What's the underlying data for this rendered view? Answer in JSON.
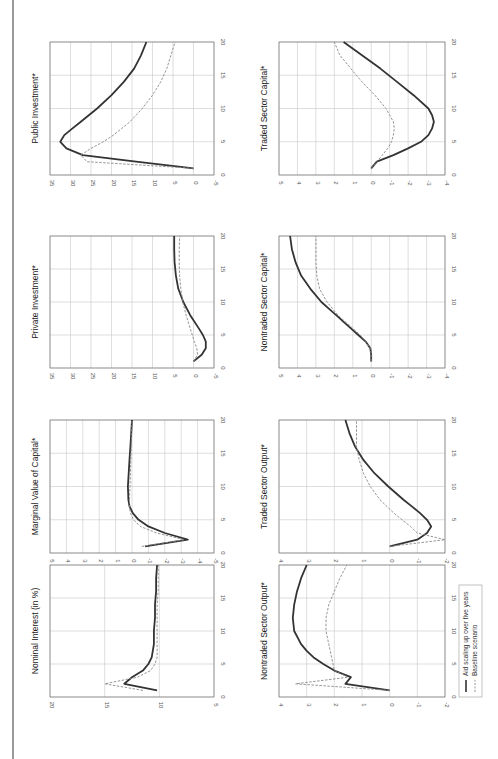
{
  "figure": {
    "orientation": "rotated-90-ccw",
    "colors": {
      "scaling": "#333333",
      "baseline": "#888888",
      "grid": "#c8c8c8",
      "axis": "#777777"
    }
  },
  "legend": {
    "items": [
      {
        "label": "Aid scaling up over five years",
        "style": "solid"
      },
      {
        "label": "Baseline scenario",
        "style": "dashed"
      }
    ]
  },
  "chart_data": [
    {
      "type": "line",
      "title": "Public Investment*",
      "xlabel": "",
      "ylabel": "",
      "xlim": [
        0,
        20
      ],
      "ylim": [
        -5,
        35
      ],
      "xticks": [
        0,
        5,
        10,
        15,
        20
      ],
      "yticks": [
        -5,
        0,
        5,
        10,
        15,
        20,
        25,
        30,
        35
      ],
      "grid": true,
      "x": [
        1,
        2,
        3,
        4,
        5,
        6,
        7,
        8,
        10,
        12,
        14,
        16,
        18,
        20
      ],
      "series": [
        {
          "name": "Aid scaling up over five years",
          "values": [
            0,
            14,
            27,
            31,
            32.5,
            31.5,
            29.5,
            27.5,
            23.5,
            20,
            17,
            14.5,
            12.8,
            11.5
          ]
        },
        {
          "name": "Baseline scenario",
          "values": [
            0,
            26,
            27.5,
            25,
            22,
            19.5,
            17.5,
            15.5,
            12.5,
            10,
            8,
            6.5,
            5.5,
            4.5
          ]
        }
      ]
    },
    {
      "type": "line",
      "title": "Private Investment*",
      "xlabel": "",
      "ylabel": "",
      "xlim": [
        0,
        20
      ],
      "ylim": [
        -5,
        35
      ],
      "xticks": [
        0,
        5,
        10,
        15,
        20
      ],
      "yticks": [
        -5,
        0,
        5,
        10,
        15,
        20,
        25,
        30,
        35
      ],
      "grid": true,
      "x": [
        1,
        2,
        3,
        4,
        5,
        6,
        8,
        10,
        12,
        14,
        16,
        18,
        20
      ],
      "series": [
        {
          "name": "Aid scaling up over five years",
          "values": [
            0,
            -2,
            -3,
            -3,
            -2.3,
            -1.3,
            0.8,
            2.5,
            3.7,
            4.3,
            4.6,
            4.7,
            4.7
          ]
        },
        {
          "name": "Baseline scenario",
          "values": [
            0,
            -1,
            -0.8,
            -0.2,
            0.3,
            0.8,
            1.8,
            2.6,
            3.1,
            3.4,
            3.5,
            3.5,
            3.4
          ]
        }
      ]
    },
    {
      "type": "line",
      "title": "Marginal Value of Capital*",
      "xlabel": "",
      "ylabel": "",
      "xlim": [
        0,
        20
      ],
      "ylim": [
        -5,
        5
      ],
      "xticks": [
        0,
        5,
        10,
        15,
        20
      ],
      "yticks": [
        -5,
        -4,
        -3,
        -2,
        -1,
        0,
        1,
        2,
        3,
        4,
        5
      ],
      "grid": true,
      "x": [
        1,
        2,
        3,
        4,
        5,
        6,
        7,
        8,
        10,
        12,
        14,
        16,
        18,
        20
      ],
      "series": [
        {
          "name": "Aid scaling up over five years",
          "values": [
            -0.8,
            -3.4,
            -2.0,
            -1.0,
            -0.4,
            -0.05,
            0.15,
            0.22,
            0.25,
            0.2,
            0.15,
            0.1,
            0.05,
            0.0
          ]
        },
        {
          "name": "Baseline scenario",
          "values": [
            -0.6,
            -3.2,
            -1.5,
            -0.5,
            -0.1,
            0.1,
            0.15,
            0.15,
            0.12,
            0.1,
            0.07,
            0.05,
            0.02,
            0.0
          ]
        }
      ]
    },
    {
      "type": "line",
      "title": "Nominal Interest (in %)",
      "xlabel": "",
      "ylabel": "",
      "xlim": [
        0,
        20
      ],
      "ylim": [
        5,
        20
      ],
      "xticks": [
        0,
        5,
        10,
        15,
        20
      ],
      "yticks": [
        5,
        10,
        15,
        20
      ],
      "grid": true,
      "x": [
        1,
        2,
        3,
        4,
        5,
        6,
        7,
        8,
        10,
        12,
        14,
        16,
        18,
        20
      ],
      "series": [
        {
          "name": "Aid scaling up over five years",
          "values": [
            10.2,
            13.2,
            12.5,
            11.5,
            11.0,
            10.7,
            10.6,
            10.5,
            10.5,
            10.4,
            10.4,
            10.3,
            10.3,
            10.2
          ]
        },
        {
          "name": "Baseline scenario",
          "values": [
            11.5,
            15.0,
            12.0,
            10.8,
            10.4,
            10.2,
            10.2,
            10.2,
            10.2,
            10.2,
            10.2,
            10.1,
            10.1,
            10.1
          ]
        }
      ]
    },
    {
      "type": "line",
      "title": "Traded Sector Capital*",
      "xlabel": "",
      "ylabel": "",
      "xlim": [
        0,
        20
      ],
      "ylim": [
        -4,
        5
      ],
      "xticks": [
        0,
        5,
        10,
        15,
        20
      ],
      "yticks": [
        -4,
        -3,
        -2,
        -1,
        0,
        1,
        2,
        3,
        4,
        5
      ],
      "grid": true,
      "x": [
        1,
        2,
        3,
        4,
        5,
        6,
        7,
        8,
        9,
        10,
        12,
        14,
        16,
        18,
        20
      ],
      "series": [
        {
          "name": "Aid scaling up over five years",
          "values": [
            0,
            -0.3,
            -1.2,
            -2.0,
            -2.7,
            -3.1,
            -3.3,
            -3.4,
            -3.3,
            -3.1,
            -2.3,
            -1.4,
            -0.5,
            0.5,
            1.5
          ]
        },
        {
          "name": "Baseline scenario",
          "values": [
            0,
            -0.3,
            -0.6,
            -0.9,
            -1.1,
            -1.2,
            -1.25,
            -1.2,
            -1.0,
            -0.8,
            -0.2,
            0.5,
            1.1,
            1.7,
            2.0
          ]
        }
      ]
    },
    {
      "type": "line",
      "title": "Nontraded Sector Capital*",
      "xlabel": "",
      "ylabel": "",
      "xlim": [
        0,
        20
      ],
      "ylim": [
        -4,
        5
      ],
      "xticks": [
        0,
        5,
        10,
        15,
        20
      ],
      "yticks": [
        -4,
        -3,
        -2,
        -1,
        0,
        1,
        2,
        3,
        4,
        5
      ],
      "grid": true,
      "x": [
        1,
        2,
        3,
        4,
        5,
        6,
        7,
        8,
        9,
        10,
        12,
        14,
        16,
        18,
        20
      ],
      "series": [
        {
          "name": "Aid scaling up over five years",
          "values": [
            0,
            0,
            0.05,
            0.3,
            0.7,
            1.1,
            1.5,
            1.9,
            2.3,
            2.7,
            3.3,
            3.8,
            4.1,
            4.3,
            4.4
          ]
        },
        {
          "name": "Baseline scenario",
          "values": [
            0,
            0,
            0.05,
            0.3,
            0.6,
            1.0,
            1.4,
            1.8,
            2.1,
            2.4,
            2.8,
            2.95,
            3.0,
            3.0,
            3.0
          ]
        }
      ]
    },
    {
      "type": "line",
      "title": "Traded Sector Output*",
      "xlabel": "",
      "ylabel": "",
      "xlim": [
        0,
        20
      ],
      "ylim": [
        -2,
        4
      ],
      "xticks": [
        0,
        5,
        10,
        15,
        20
      ],
      "yticks": [
        -2,
        -1,
        0,
        1,
        2,
        3,
        4
      ],
      "grid": true,
      "x": [
        1,
        2,
        3,
        4,
        5,
        6,
        7,
        8,
        10,
        12,
        14,
        15,
        16,
        18,
        20
      ],
      "series": [
        {
          "name": "Aid scaling up over five years",
          "values": [
            0,
            -1.0,
            -1.35,
            -1.5,
            -1.35,
            -1.1,
            -0.8,
            -0.5,
            0.05,
            0.55,
            0.95,
            1.1,
            1.25,
            1.45,
            1.6
          ]
        },
        {
          "name": "Baseline scenario",
          "values": [
            0,
            -2.0,
            -1.0,
            -0.75,
            -0.45,
            -0.15,
            0.1,
            0.35,
            0.7,
            0.95,
            1.1,
            1.15,
            1.2,
            1.2,
            1.2
          ]
        }
      ]
    },
    {
      "type": "line",
      "title": "Nontraded Sector Output*",
      "xlabel": "",
      "ylabel": "",
      "xlim": [
        0,
        20
      ],
      "ylim": [
        -2,
        4
      ],
      "xticks": [
        0,
        5,
        10,
        15,
        20
      ],
      "yticks": [
        -2,
        -1,
        0,
        1,
        2,
        3,
        4
      ],
      "grid": true,
      "x": [
        1,
        2,
        3,
        4,
        5,
        6,
        7,
        8,
        10,
        12,
        14,
        16,
        18,
        20
      ],
      "series": [
        {
          "name": "Aid scaling up over five years",
          "values": [
            0,
            1.6,
            1.4,
            2.0,
            2.4,
            2.75,
            3.0,
            3.2,
            3.45,
            3.5,
            3.45,
            3.35,
            3.2,
            3.0
          ]
        },
        {
          "name": "Baseline scenario",
          "values": [
            0,
            3.4,
            1.5,
            2.0,
            2.05,
            2.1,
            2.15,
            2.2,
            2.3,
            2.3,
            2.2,
            2.0,
            1.8,
            1.55
          ]
        }
      ]
    }
  ]
}
